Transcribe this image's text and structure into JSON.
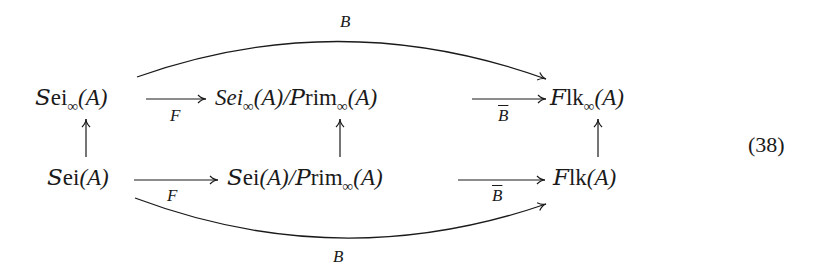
{
  "equation_number": "(38)",
  "nodes": {
    "top_left": {
      "cal": "S",
      "rest": "ei",
      "sub": "∞",
      "arg": "(A)"
    },
    "top_middle": {
      "italic": "Sei",
      "sub": "∞",
      "arg": "(A)/",
      "cal2": "P",
      "rest2": "rim",
      "sub2": "∞",
      "arg2": "(A)"
    },
    "top_right": {
      "cal": "F",
      "rest": "lk",
      "sub": "∞",
      "arg": "(A)"
    },
    "bottom_left": {
      "cal": "S",
      "rest": "ei",
      "arg": "(A)"
    },
    "bottom_middle": {
      "cal": "S",
      "rest": "ei",
      "arg": "(A)/",
      "cal2": "P",
      "rest2": "rim",
      "sub2": "∞",
      "arg2": "(A)"
    },
    "bottom_right": {
      "cal": "F",
      "rest": "lk",
      "arg": "(A)"
    }
  },
  "arrows": {
    "top_curve": {
      "label": "B"
    },
    "top_left_mid": {
      "label": "F"
    },
    "top_mid_right": {
      "label": "B"
    },
    "bottom_left_mid": {
      "label": "F"
    },
    "bottom_mid_right": {
      "label": "B"
    },
    "bottom_curve": {
      "label": "B"
    }
  },
  "colors": {
    "ink": "#1a1a1a",
    "background": "#ffffff"
  }
}
